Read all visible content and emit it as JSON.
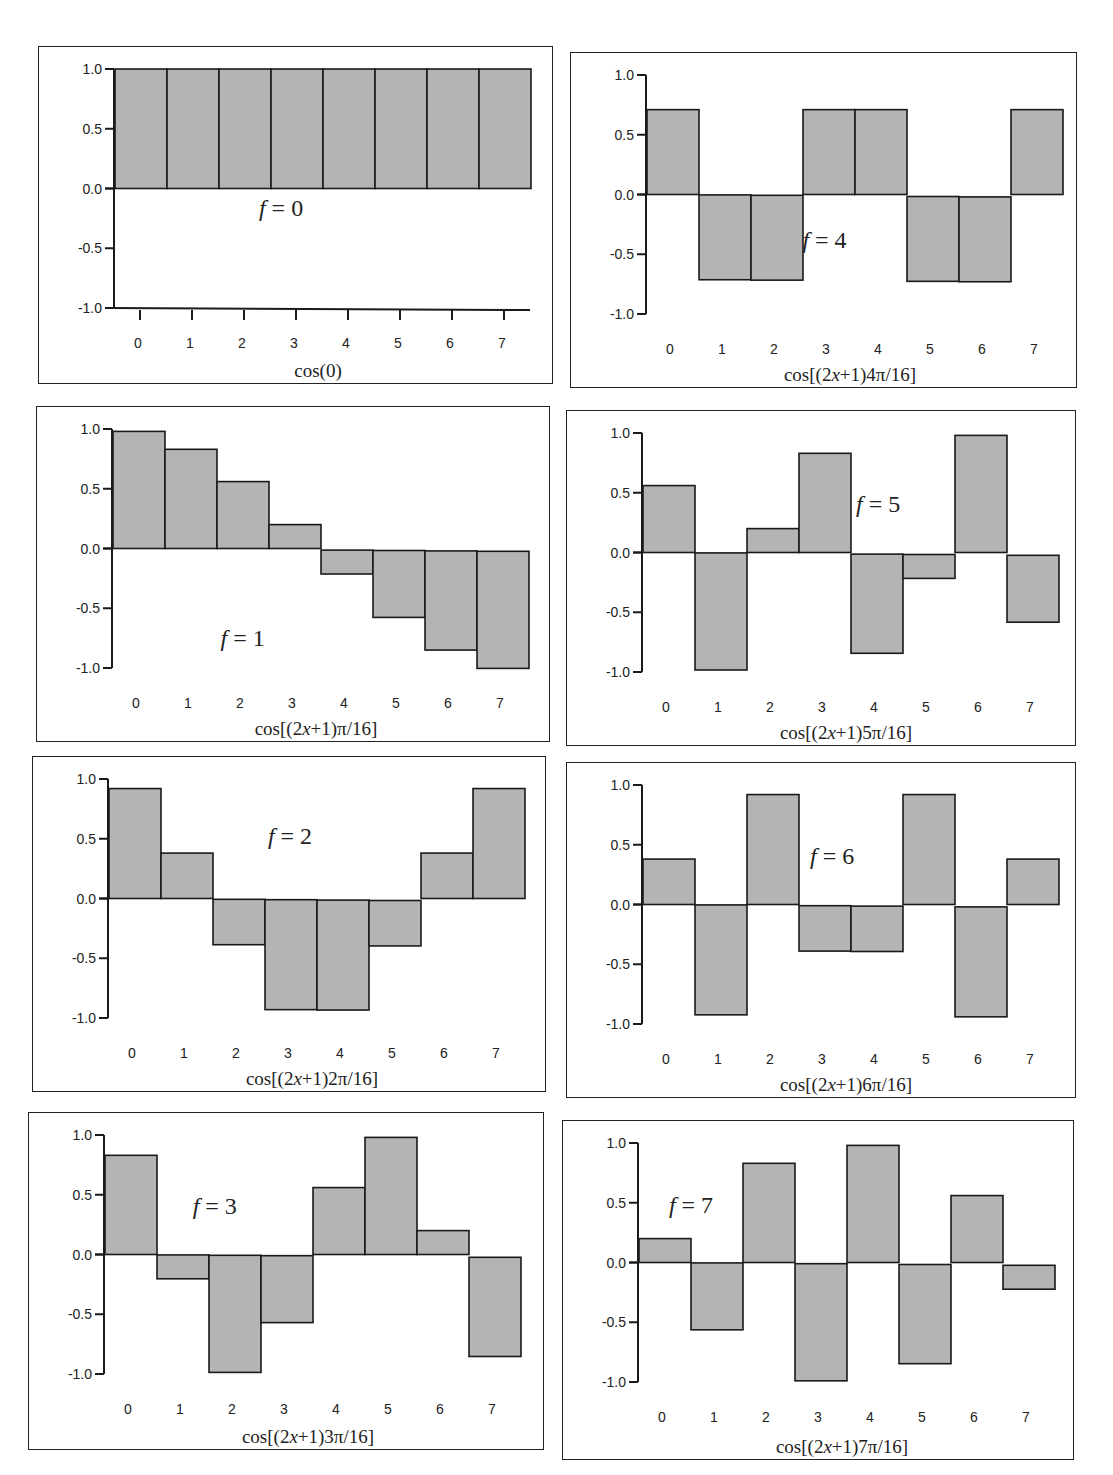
{
  "figure": {
    "colors": {
      "bar_fill": "#b4b4b4",
      "bar_stroke": "#1a1a1a",
      "axis": "#1a1a1a",
      "text": "#222222"
    },
    "y_ticks": [
      "1.0",
      "0.5",
      "0.0",
      "-0.5",
      "-1.0"
    ],
    "x_ticks": [
      "0",
      "1",
      "2",
      "3",
      "4",
      "5",
      "6",
      "7"
    ]
  },
  "chart_data": [
    {
      "type": "bar",
      "title": "f = 0",
      "freq": 0,
      "xlabel": "cos(0)",
      "caption_parts": [
        {
          "t": "cos(0)",
          "i": false
        }
      ],
      "categories": [
        0,
        1,
        2,
        3,
        4,
        5,
        6,
        7
      ],
      "values": [
        1.0,
        1.0,
        1.0,
        1.0,
        1.0,
        1.0,
        1.0,
        1.0
      ],
      "ylim": [
        -1.0,
        1.0
      ],
      "yticks": [
        1.0,
        0.5,
        0.0,
        -0.5,
        -1.0
      ],
      "grid": false,
      "label_pos": [
        0.47,
        0.5
      ]
    },
    {
      "type": "bar",
      "title": "f = 1",
      "freq": 1,
      "xlabel": "cos[(2x+1)π/16]",
      "caption_parts": [
        {
          "t": "cos[(2",
          "i": false
        },
        {
          "t": "x",
          "i": true
        },
        {
          "t": "+1)π/16]",
          "i": false
        }
      ],
      "categories": [
        0,
        1,
        2,
        3,
        4,
        5,
        6,
        7
      ],
      "values": [
        0.98,
        0.83,
        0.56,
        0.2,
        -0.2,
        -0.56,
        -0.83,
        -0.98
      ],
      "ylim": [
        -1.0,
        1.0
      ],
      "yticks": [
        1.0,
        0.5,
        0.0,
        -0.5,
        -1.0
      ],
      "grid": false,
      "label_pos": [
        0.4,
        0.71
      ]
    },
    {
      "type": "bar",
      "title": "f = 2",
      "freq": 2,
      "xlabel": "cos[(2x+1)2π/16]",
      "caption_parts": [
        {
          "t": "cos[(2",
          "i": false
        },
        {
          "t": "x",
          "i": true
        },
        {
          "t": "+1)2π/16]",
          "i": false
        }
      ],
      "categories": [
        0,
        1,
        2,
        3,
        4,
        5,
        6,
        7
      ],
      "values": [
        0.92,
        0.38,
        -0.38,
        -0.92,
        -0.92,
        -0.38,
        0.38,
        0.92
      ],
      "ylim": [
        -1.0,
        1.0
      ],
      "yticks": [
        1.0,
        0.5,
        0.0,
        -0.5,
        -1.0
      ],
      "grid": false,
      "label_pos": [
        0.5,
        0.26
      ]
    },
    {
      "type": "bar",
      "title": "f = 3",
      "freq": 3,
      "xlabel": "cos[(2x+1)3π/16]",
      "caption_parts": [
        {
          "t": "cos[(2",
          "i": false
        },
        {
          "t": "x",
          "i": true
        },
        {
          "t": "+1)3π/16]",
          "i": false
        }
      ],
      "categories": [
        0,
        1,
        2,
        3,
        4,
        5,
        6,
        7
      ],
      "values": [
        0.83,
        -0.2,
        -0.98,
        -0.56,
        0.56,
        0.98,
        0.2,
        -0.83
      ],
      "ylim": [
        -1.0,
        1.0
      ],
      "yticks": [
        1.0,
        0.5,
        0.0,
        -0.5,
        -1.0
      ],
      "grid": false,
      "label_pos": [
        0.36,
        0.3
      ]
    },
    {
      "type": "bar",
      "title": "f = 4",
      "freq": 4,
      "xlabel": "cos[(2x+1)4π/16]",
      "caption_parts": [
        {
          "t": "cos[(2",
          "i": false
        },
        {
          "t": "x",
          "i": true
        },
        {
          "t": "+1)4π/16]",
          "i": false
        }
      ],
      "categories": [
        0,
        1,
        2,
        3,
        4,
        5,
        6,
        7
      ],
      "values": [
        0.71,
        -0.71,
        -0.71,
        0.71,
        0.71,
        -0.71,
        -0.71,
        0.71
      ],
      "ylim": [
        -1.0,
        1.0
      ],
      "yticks": [
        1.0,
        0.5,
        0.0,
        -0.5,
        -1.0
      ],
      "grid": false,
      "label_pos": [
        0.5,
        0.58
      ]
    },
    {
      "type": "bar",
      "title": "f = 5",
      "freq": 5,
      "xlabel": "cos[(2x+1)5π/16]",
      "caption_parts": [
        {
          "t": "cos[(2",
          "i": false
        },
        {
          "t": "x",
          "i": true
        },
        {
          "t": "+1)5π/16]",
          "i": false
        }
      ],
      "categories": [
        0,
        1,
        2,
        3,
        4,
        5,
        6,
        7
      ],
      "values": [
        0.56,
        -0.98,
        0.2,
        0.83,
        -0.83,
        -0.2,
        0.98,
        -0.56
      ],
      "ylim": [
        -1.0,
        1.0
      ],
      "yticks": [
        1.0,
        0.5,
        0.0,
        -0.5,
        -1.0
      ],
      "grid": false,
      "label_pos": [
        0.61,
        0.3
      ]
    },
    {
      "type": "bar",
      "title": "f = 6",
      "freq": 6,
      "xlabel": "cos[(2x+1)6π/16]",
      "caption_parts": [
        {
          "t": "cos[(2",
          "i": false
        },
        {
          "t": "x",
          "i": true
        },
        {
          "t": "+1)6π/16]",
          "i": false
        }
      ],
      "categories": [
        0,
        1,
        2,
        3,
        4,
        5,
        6,
        7
      ],
      "values": [
        0.38,
        -0.92,
        0.92,
        -0.38,
        -0.38,
        0.92,
        -0.92,
        0.38
      ],
      "ylim": [
        -1.0,
        1.0
      ],
      "yticks": [
        1.0,
        0.5,
        0.0,
        -0.5,
        -1.0
      ],
      "grid": false,
      "label_pos": [
        0.52,
        0.3
      ]
    },
    {
      "type": "bar",
      "title": "f = 7",
      "freq": 7,
      "xlabel": "cos[(2x+1)7π/16]",
      "caption_parts": [
        {
          "t": "cos[(2",
          "i": false
        },
        {
          "t": "x",
          "i": true
        },
        {
          "t": "+1)7π/16]",
          "i": false
        }
      ],
      "categories": [
        0,
        1,
        2,
        3,
        4,
        5,
        6,
        7
      ],
      "values": [
        0.2,
        -0.56,
        0.83,
        -0.98,
        0.98,
        -0.83,
        0.56,
        -0.2
      ],
      "ylim": [
        -1.0,
        1.0
      ],
      "yticks": [
        1.0,
        0.5,
        0.0,
        -0.5,
        -1.0
      ],
      "grid": false,
      "label_pos": [
        0.25,
        0.27
      ]
    }
  ],
  "panels_layout": [
    {
      "freq": 0,
      "box": [
        38,
        46,
        515,
        338
      ]
    },
    {
      "freq": 4,
      "box": [
        570,
        52,
        507,
        336
      ]
    },
    {
      "freq": 1,
      "box": [
        36,
        406,
        514,
        336
      ]
    },
    {
      "freq": 5,
      "box": [
        566,
        410,
        510,
        336
      ]
    },
    {
      "freq": 2,
      "box": [
        32,
        756,
        514,
        336
      ]
    },
    {
      "freq": 6,
      "box": [
        566,
        762,
        510,
        336
      ]
    },
    {
      "freq": 3,
      "box": [
        28,
        1112,
        516,
        338
      ]
    },
    {
      "freq": 7,
      "box": [
        562,
        1120,
        512,
        340
      ]
    }
  ]
}
